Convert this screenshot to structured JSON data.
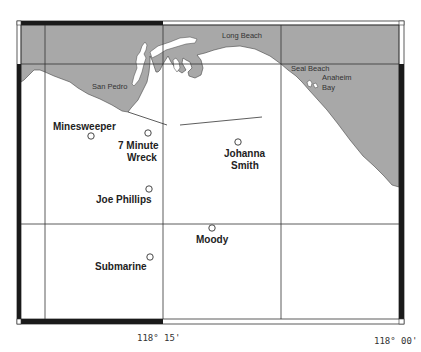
{
  "map": {
    "colors": {
      "land": "#a8a8a8",
      "water": "#ffffff",
      "grid": "#333333",
      "frame_dark": "#1a1a1a",
      "frame_light": "#ffffff"
    },
    "towns": [
      {
        "name": "San Pedro"
      },
      {
        "name": "Long Beach"
      },
      {
        "name": "Seal Beach"
      },
      {
        "name": "Anaheim"
      },
      {
        "name": "Bay"
      }
    ],
    "dive_sites": [
      {
        "name": "Minesweeper"
      },
      {
        "name": "7 Minute",
        "name2": "Wreck"
      },
      {
        "name": "Johanna",
        "name2": "Smith"
      },
      {
        "name": "Joe Phillips"
      },
      {
        "name": "Moody"
      },
      {
        "name": "Submarine"
      }
    ],
    "longitude_labels": [
      {
        "label": "118° 15'"
      },
      {
        "label": "118° 00'"
      }
    ]
  }
}
